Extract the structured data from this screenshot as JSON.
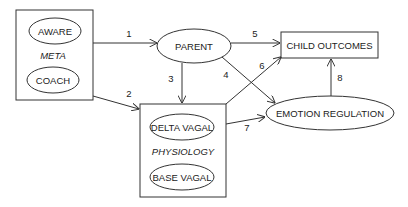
{
  "diagram": {
    "groups": {
      "meta": {
        "label": "META",
        "items": [
          "AWARE",
          "COACH"
        ]
      },
      "physiology": {
        "label": "PHYSIOLOGY",
        "items": [
          "DELTA VAGAL",
          "BASE VAGAL"
        ]
      }
    },
    "nodes": {
      "aware": "AWARE",
      "coach": "COACH",
      "parent": "PARENT",
      "child_outcomes": "CHILD OUTCOMES",
      "emotion_regulation": "EMOTION REGULATION",
      "delta_vagal": "DELTA VAGAL",
      "base_vagal": "BASE VAGAL"
    },
    "edges": [
      {
        "id": "1",
        "label": "1",
        "from": "META",
        "to": "PARENT"
      },
      {
        "id": "2",
        "label": "2",
        "from": "META",
        "to": "PHYSIOLOGY"
      },
      {
        "id": "3",
        "label": "3",
        "from": "PARENT",
        "to": "PHYSIOLOGY"
      },
      {
        "id": "4",
        "label": "4",
        "from": "PARENT",
        "to": "EMOTION REGULATION"
      },
      {
        "id": "5",
        "label": "5",
        "from": "PARENT",
        "to": "CHILD OUTCOMES"
      },
      {
        "id": "6",
        "label": "6",
        "from": "PHYSIOLOGY",
        "to": "CHILD OUTCOMES"
      },
      {
        "id": "7",
        "label": "7",
        "from": "PHYSIOLOGY",
        "to": "EMOTION REGULATION"
      },
      {
        "id": "8",
        "label": "8",
        "from": "EMOTION REGULATION",
        "to": "CHILD OUTCOMES"
      }
    ]
  }
}
